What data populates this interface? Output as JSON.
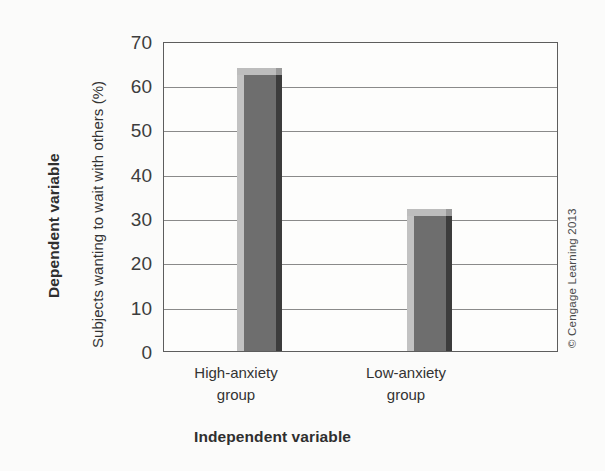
{
  "chart_data": {
    "type": "bar",
    "title": "",
    "subtitle": "",
    "categories": [
      "High-anxiety group",
      "Low-anxiety group"
    ],
    "category_lines": [
      [
        "High-anxiety",
        "group"
      ],
      [
        "Low-anxiety",
        "group"
      ]
    ],
    "values": [
      63,
      31
    ],
    "xlabel": "Independent variable",
    "ylabel": "Subjects wanting to wait with others (%)",
    "ylabel_outer": "Dependent variable",
    "ylim": [
      0,
      70
    ],
    "yticks": [
      0,
      10,
      20,
      30,
      40,
      50,
      60,
      70
    ],
    "ytick_labels": [
      "0",
      "10",
      "20",
      "30",
      "40",
      "50",
      "60",
      "70"
    ],
    "grid": true,
    "grid_axis": "y",
    "legend": null,
    "legend_position": "none",
    "annotations": [],
    "colors": {
      "bar_face": "#6e6e6e",
      "bar_highlight": "#c2c2c2",
      "bar_shadow": "#3c3c3c",
      "gridline": "#8a8a8a",
      "frame": "#5d5d5d",
      "background": "#fbfbfa",
      "plot_background": "#fdfdfc",
      "text": "#333333"
    }
  },
  "axis": {
    "y_outer_title": "Dependent variable",
    "y_inner_title": "Subjects wanting to wait with others (%)",
    "x_title": "Independent variable"
  },
  "ticks": {
    "y": [
      "70",
      "60",
      "50",
      "40",
      "30",
      "20",
      "10",
      "0"
    ]
  },
  "bars": [
    {
      "label_line1": "High-anxiety",
      "label_line2": "group",
      "value": 63
    },
    {
      "label_line1": "Low-anxiety",
      "label_line2": "group",
      "value": 31
    }
  ],
  "credit": {
    "text": "© Cengage Learning 2013"
  }
}
